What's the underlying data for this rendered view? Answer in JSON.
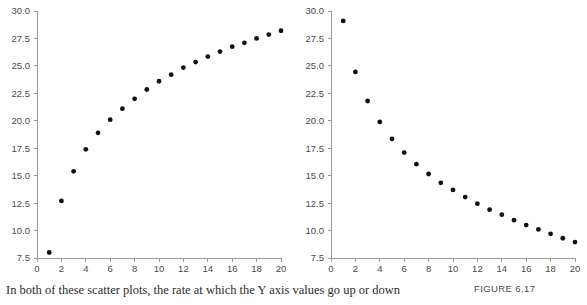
{
  "figure": {
    "number_label": "FIGURE 6.17",
    "caption": "In both of these scatter plots, the rate at which the Y axis values go up or down"
  },
  "chart_data": [
    {
      "type": "scatter",
      "panel": "left",
      "title": "",
      "xlabel": "",
      "ylabel": "",
      "xlim": [
        0,
        20
      ],
      "ylim": [
        7.5,
        30.0
      ],
      "xticks": [
        0,
        2,
        4,
        6,
        8,
        10,
        12,
        14,
        16,
        18,
        20
      ],
      "xtick_labels": [
        "0",
        "2",
        "4",
        "6",
        "8",
        "10",
        "12",
        "14",
        "16",
        "18",
        "20"
      ],
      "yticks": [
        7.5,
        10.0,
        12.5,
        15.0,
        17.5,
        20.0,
        22.5,
        25.0,
        27.5,
        30.0
      ],
      "ytick_labels": [
        "7.5",
        "10.0",
        "12.5",
        "15.0",
        "17.5",
        "20.0",
        "22.5",
        "25.0",
        "27.5",
        "30.0"
      ],
      "grid": false,
      "legend": false,
      "marker_color": "#111111",
      "axis_color": "#9a9a9a",
      "x": [
        1,
        2,
        3,
        4,
        5,
        6,
        7,
        8,
        9,
        10,
        11,
        12,
        13,
        14,
        15,
        16,
        17,
        18,
        19,
        20
      ],
      "y": [
        8.0,
        12.7,
        15.4,
        17.4,
        18.9,
        20.1,
        21.1,
        22.0,
        22.85,
        23.6,
        24.2,
        24.85,
        25.35,
        25.85,
        26.3,
        26.75,
        27.1,
        27.5,
        27.85,
        28.2
      ]
    },
    {
      "type": "scatter",
      "panel": "right",
      "title": "",
      "xlabel": "",
      "ylabel": "",
      "xlim": [
        0,
        20
      ],
      "ylim": [
        7.5,
        30.0
      ],
      "xticks": [
        0,
        2,
        4,
        6,
        8,
        10,
        12,
        14,
        16,
        18,
        20
      ],
      "xtick_labels": [
        "0",
        "2",
        "4",
        "6",
        "8",
        "10",
        "12",
        "14",
        "16",
        "18",
        "20"
      ],
      "yticks": [
        7.5,
        10.0,
        12.5,
        15.0,
        17.5,
        20.0,
        22.5,
        25.0,
        27.5,
        30.0
      ],
      "ytick_labels": [
        "7.5",
        "10.0",
        "12.5",
        "15.0",
        "17.5",
        "20.0",
        "22.5",
        "25.0",
        "27.5",
        "30.0"
      ],
      "grid": false,
      "legend": false,
      "marker_color": "#111111",
      "axis_color": "#9a9a9a",
      "x": [
        1,
        2,
        3,
        4,
        5,
        6,
        7,
        8,
        9,
        10,
        11,
        12,
        13,
        14,
        15,
        16,
        17,
        18,
        19,
        20
      ],
      "y": [
        29.1,
        24.45,
        21.8,
        19.9,
        18.35,
        17.1,
        16.05,
        15.15,
        14.35,
        13.7,
        13.05,
        12.45,
        11.9,
        11.45,
        10.95,
        10.5,
        10.1,
        9.7,
        9.3,
        8.95
      ]
    }
  ]
}
